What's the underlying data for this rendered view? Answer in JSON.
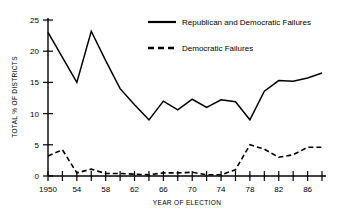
{
  "chart_data": {
    "type": "line",
    "title": "",
    "xlabel": "YEAR OF ELECTION",
    "ylabel": "TOTAL % OF DISTRICTS",
    "xlim": [
      1950,
      1988
    ],
    "ylim": [
      0,
      25
    ],
    "grid": false,
    "legend_position": "top-right",
    "x": [
      1950,
      1952,
      1954,
      1956,
      1958,
      1960,
      1962,
      1964,
      1966,
      1968,
      1970,
      1972,
      1974,
      1976,
      1978,
      1980,
      1982,
      1984,
      1986,
      1988
    ],
    "xtick_labels": [
      "1950",
      "",
      "54",
      "",
      "58",
      "",
      "62",
      "",
      "66",
      "",
      "70",
      "",
      "74",
      "",
      "78",
      "",
      "82",
      "",
      "86",
      ""
    ],
    "ytick_labels": [
      "0",
      "5",
      "10",
      "15",
      "20",
      "25"
    ],
    "ytick_values": [
      0,
      5,
      10,
      15,
      20,
      25
    ],
    "series": [
      {
        "name": "Republican and Democratic Failures",
        "style": "solid",
        "values": [
          23.0,
          19.0,
          15.0,
          23.2,
          18.5,
          14.0,
          11.4,
          9.0,
          12.0,
          10.6,
          12.3,
          11.0,
          12.2,
          11.9,
          9.0,
          13.6,
          15.3,
          15.2,
          15.7,
          16.5
        ]
      },
      {
        "name": "Democratic Failures",
        "style": "dashed",
        "values": [
          3.2,
          4.2,
          0.5,
          1.1,
          0.4,
          0.4,
          0.3,
          0.2,
          0.5,
          0.5,
          0.6,
          0.2,
          0.2,
          1.0,
          5.0,
          4.3,
          3.0,
          3.4,
          4.6,
          4.6
        ]
      }
    ]
  },
  "legend": {
    "items": [
      {
        "label": "Republican and Democratic Failures",
        "style": "solid"
      },
      {
        "label": "Democratic Failures",
        "style": "dashed"
      }
    ]
  },
  "axes": {
    "y_title": "TOTAL % OF DISTRICTS",
    "x_title": "YEAR OF ELECTION"
  }
}
